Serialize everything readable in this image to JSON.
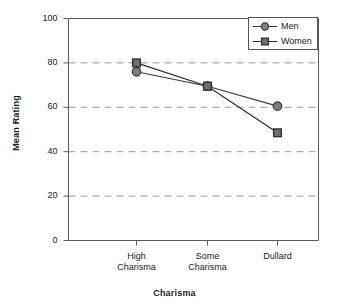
{
  "chart_data": {
    "type": "line",
    "title": "",
    "xlabel": "Charisma",
    "ylabel": "Mean Rating",
    "categories": [
      "High Charisma",
      "Some Charisma",
      "Dullard"
    ],
    "category_lines": [
      [
        "High",
        "Charisma"
      ],
      [
        "Some",
        "Charisma"
      ],
      [
        "Dullard",
        ""
      ]
    ],
    "series": [
      {
        "name": "Men",
        "marker": "circle",
        "color": "#808080",
        "edge_color": "#3a3a3a",
        "values": [
          76,
          69.5,
          60.5
        ]
      },
      {
        "name": "Women",
        "marker": "square",
        "color": "#6e6e6e",
        "edge_color": "#2b2b2b",
        "values": [
          80,
          69.5,
          48.5
        ]
      }
    ],
    "ylim": [
      0,
      100
    ],
    "yticks": [
      0,
      20,
      40,
      60,
      80,
      100
    ],
    "ytick_labels": [
      "0",
      "20",
      "40",
      "60",
      "80",
      "100"
    ],
    "grid": true,
    "grid_style": "dashed",
    "grid_color": "#9a9a9a",
    "grid_values": [
      20,
      40,
      60,
      80
    ],
    "legend_position": "top-right",
    "axis_color": "#5a5a5a",
    "background": "#ffffff"
  },
  "legend": {
    "entries": [
      {
        "label": "Men"
      },
      {
        "label": "Women"
      }
    ]
  }
}
